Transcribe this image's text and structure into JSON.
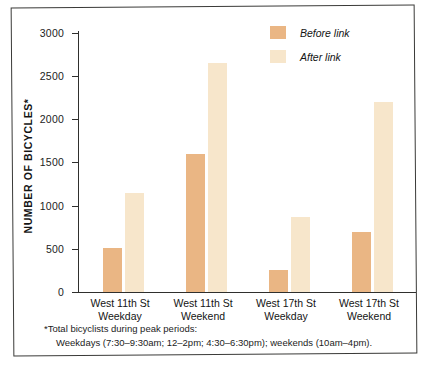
{
  "chart_data": {
    "type": "bar",
    "title": "",
    "xlabel": "",
    "ylabel": "NUMBER OF BICYCLES*",
    "ylim": [
      0,
      3000
    ],
    "yticks": [
      0,
      500,
      1000,
      1500,
      2000,
      2500,
      3000
    ],
    "ytick_labels": [
      "0",
      "500",
      "1000",
      "1500",
      "2000",
      "2500",
      "3000"
    ],
    "grid": false,
    "legend_position": "top-right",
    "categories": [
      "West 11th St Weekday",
      "West 11th St Weekend",
      "West 17th St Weekday",
      "West 17th St Weekend"
    ],
    "category_lines": [
      [
        "West 11th St",
        "Weekday"
      ],
      [
        "West 11th St",
        "Weekend"
      ],
      [
        "West 17th St",
        "Weekday"
      ],
      [
        "West 17th St",
        "Weekend"
      ]
    ],
    "series": [
      {
        "name": "Before link",
        "color": "#eab684",
        "values": [
          510,
          1600,
          250,
          700
        ]
      },
      {
        "name": "After link",
        "color": "#f7e6cb",
        "values": [
          1150,
          2650,
          870,
          2200
        ]
      }
    ],
    "annotations": [
      "*Total bicyclists during peak periods:",
      "Weekdays (7:30–9:30am; 12–2pm; 4:30–6:30pm); weekends (10am–4pm)."
    ]
  },
  "axis": {
    "y_title": "NUMBER OF BICYCLES*",
    "tick_3000": "3000",
    "tick_2500": "2500",
    "tick_2000": "2000",
    "tick_1500": "1500",
    "tick_1000": "1000",
    "tick_500": "500",
    "tick_0": "0"
  },
  "legend": {
    "before_label": "Before link",
    "after_label": "After link"
  },
  "categories": {
    "g1_line1": "West 11th St",
    "g1_line2": "Weekday",
    "g2_line1": "West 11th St",
    "g2_line2": "Weekend",
    "g3_line1": "West 17th St",
    "g3_line2": "Weekday",
    "g4_line1": "West 17th St",
    "g4_line2": "Weekend"
  },
  "footnote": {
    "line1": "*Total bicyclists during peak periods:",
    "line2": "Weekdays (7:30–9:30am; 12–2pm; 4:30–6:30pm); weekends (10am–4pm)."
  },
  "colors": {
    "before": "#eab684",
    "after": "#f7e6cb",
    "axis": "#2f2f2d",
    "frame": "#3a3a38"
  }
}
